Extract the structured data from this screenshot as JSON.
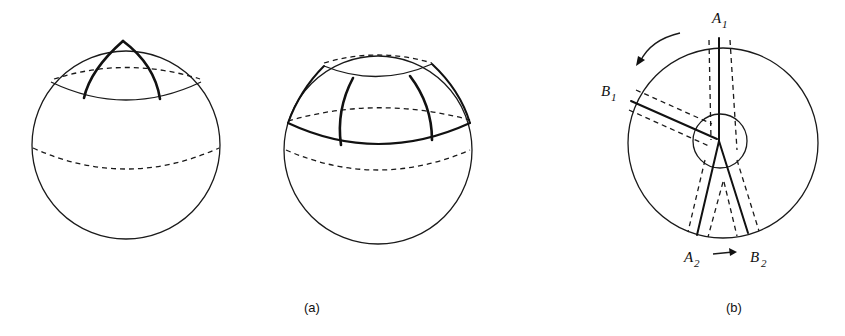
{
  "figure": {
    "panel_a": {
      "caption": "(a)",
      "spheres": [
        {
          "name": "sphere-left",
          "description": "triangle near pole bounded by arcs"
        },
        {
          "name": "sphere-right",
          "description": "band with two meridian arcs"
        }
      ]
    },
    "panel_b": {
      "caption": "(b)",
      "labels": {
        "a1": {
          "main": "A",
          "sub": "1"
        },
        "b1": {
          "main": "B",
          "sub": "1"
        },
        "a2": {
          "main": "A",
          "sub": "2"
        },
        "b2": {
          "main": "B",
          "sub": "2"
        }
      }
    }
  }
}
